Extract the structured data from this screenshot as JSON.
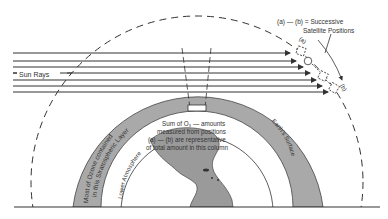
{
  "diagram": {
    "colors": {
      "background": "#ffffff",
      "line": "#333333",
      "ozone_band": "#a9a9a9",
      "earth": "#9a9a9a"
    },
    "labels": {
      "sun_rays": "Sun Rays",
      "legend_line1": "(a) — (b) = Successive",
      "legend_line2": "Satellite Positions",
      "pos_a": "(a)",
      "pos_b": "(b)",
      "ozone_line1": "Most of Ozone contained",
      "ozone_line2": "in this Stratospheric Layer",
      "lower_atmosphere": "Lower Atmosphere",
      "earth_surface": "Earth's Surface",
      "sum_line1": "Sum of O₃ — amounts",
      "sum_line2": "measured from positions",
      "sum_line3": "(a) — (b) are representative",
      "sum_line4": "of total amount in this column"
    }
  }
}
